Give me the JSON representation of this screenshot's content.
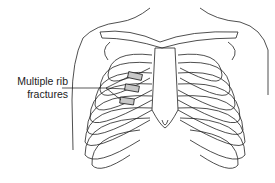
{
  "diagram": {
    "annotation": {
      "line1": "Multiple rib",
      "line2": "fractures"
    },
    "highlight_color": "#c8c8c8",
    "line_color": "#222222"
  }
}
